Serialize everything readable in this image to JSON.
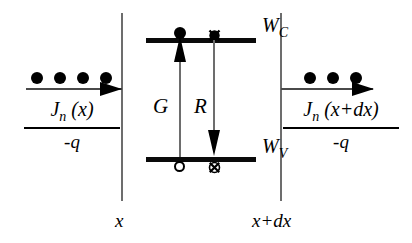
{
  "figure": {
    "type": "energy-band-diagram"
  },
  "bands": {
    "conduction": {
      "label_main": "W",
      "label_sub": "C",
      "markers": [
        {
          "name": "electron-generated",
          "glyph": "filled-circle"
        },
        {
          "name": "electron-recombining",
          "glyph": "crossed-circle"
        }
      ]
    },
    "valence": {
      "label_main": "W",
      "label_sub": "V",
      "markers": [
        {
          "name": "hole-generated",
          "glyph": "open-circle"
        },
        {
          "name": "hole-recombining",
          "glyph": "crossed-circle"
        }
      ]
    }
  },
  "processes": {
    "generation": {
      "label": "G",
      "direction": "up"
    },
    "recombination": {
      "label": "R",
      "direction": "down"
    }
  },
  "flux_left": {
    "numerator_main": "J",
    "numerator_sub": "n",
    "numerator_arg": " (x)",
    "denominator": "-q",
    "carrier_count": 4,
    "arrow_direction": "right"
  },
  "flux_right": {
    "numerator_main": "J",
    "numerator_sub": "n",
    "numerator_arg": " (x+dx)",
    "denominator": "-q",
    "carrier_count": 3,
    "arrow_direction": "right"
  },
  "axis": {
    "left_boundary_label": "x",
    "right_boundary_label": "x+dx"
  },
  "colors": {
    "ink": "#000000",
    "band_line": "#0a0a0a",
    "boundary_line": "#6d6d6d",
    "background": "#ffffff"
  }
}
